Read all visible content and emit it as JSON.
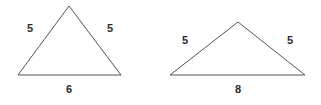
{
  "figure": {
    "background_color": "#ffffff",
    "line_color": "#555555",
    "label_color": "#2b2b2b",
    "shapes": [
      {
        "name": "isosceles-triangle-left",
        "vertices": {
          "apex": [
            69,
            6
          ],
          "base_left": [
            18,
            75
          ],
          "base_right": [
            121,
            75
          ]
        },
        "labels": {
          "left_side": "5",
          "right_side": "5",
          "base": "6"
        },
        "label_positions": {
          "left_side": [
            30,
            29
          ],
          "right_side": [
            110,
            29
          ],
          "base": [
            69,
            90
          ]
        }
      },
      {
        "name": "isosceles-triangle-right",
        "vertices": {
          "apex": [
            238,
            22
          ],
          "base_left": [
            170,
            75
          ],
          "base_right": [
            305,
            75
          ]
        },
        "labels": {
          "left_side": "5",
          "right_side": "5",
          "base": "8"
        },
        "label_positions": {
          "left_side": [
            185,
            41
          ],
          "right_side": [
            290,
            41
          ],
          "base": [
            238,
            90
          ]
        }
      }
    ]
  }
}
